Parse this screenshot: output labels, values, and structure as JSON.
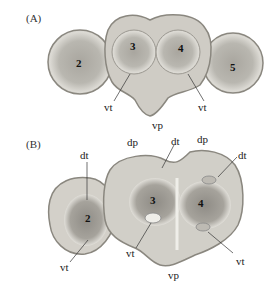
{
  "figure": {
    "panel_a": {
      "label": "(A)",
      "numbers": [
        "2",
        "3",
        "4",
        "5"
      ],
      "annotations": {
        "vt_left": "vt",
        "vt_right": "vt",
        "vp": "vp"
      }
    },
    "panel_b": {
      "label": "(B)",
      "numbers": [
        "2",
        "3",
        "4"
      ],
      "annotations": {
        "dt_left": "dt",
        "dp_left": "dp",
        "dt_mid": "dt",
        "dp_right": "dp",
        "dt_right": "dt",
        "vt_left": "vt",
        "vt_mid": "vt",
        "vt_right": "vt",
        "vp": "vp"
      }
    },
    "colors": {
      "tissue_outer": "#b9b9b2",
      "tissue_fill": "#d6d4cd",
      "tissue_dark": "#8f8c86",
      "membrane": "#7d7a74",
      "background": "#ffffff"
    }
  }
}
